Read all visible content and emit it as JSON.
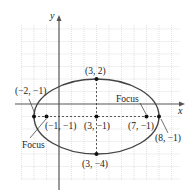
{
  "diagram": {
    "type": "ellipse-graph",
    "axes": {
      "x_label": "x",
      "y_label": "y"
    },
    "grid": {
      "x_min": -3,
      "x_max": 10,
      "y_min": -6,
      "y_max": 6,
      "unit_px": 12.5,
      "origin_px": [
        59,
        104
      ]
    },
    "ellipse": {
      "center": [
        3,
        -1
      ],
      "rx": 5,
      "ry": 3,
      "stroke": "#444444"
    },
    "points": [
      {
        "id": "top-vertex",
        "coords": [
          3,
          2
        ],
        "label": "(3, 2)"
      },
      {
        "id": "bottom-vertex",
        "coords": [
          3,
          -4
        ],
        "label": "(3, −4)"
      },
      {
        "id": "center",
        "coords": [
          3,
          -1
        ],
        "label": "(3, −1)"
      },
      {
        "id": "left-vertex",
        "coords": [
          -2,
          -1
        ],
        "label": "(−2, −1)"
      },
      {
        "id": "right-vertex",
        "coords": [
          8,
          -1
        ],
        "label": "(8, −1)"
      },
      {
        "id": "left-focus",
        "coords": [
          -1,
          -1
        ],
        "label": "(−1, −1)"
      },
      {
        "id": "right-focus",
        "coords": [
          7,
          -1
        ],
        "label": "(7, −1)"
      }
    ],
    "annotations": [
      {
        "id": "focus-left",
        "text": "Focus"
      },
      {
        "id": "focus-right",
        "text": "Focus"
      }
    ]
  }
}
